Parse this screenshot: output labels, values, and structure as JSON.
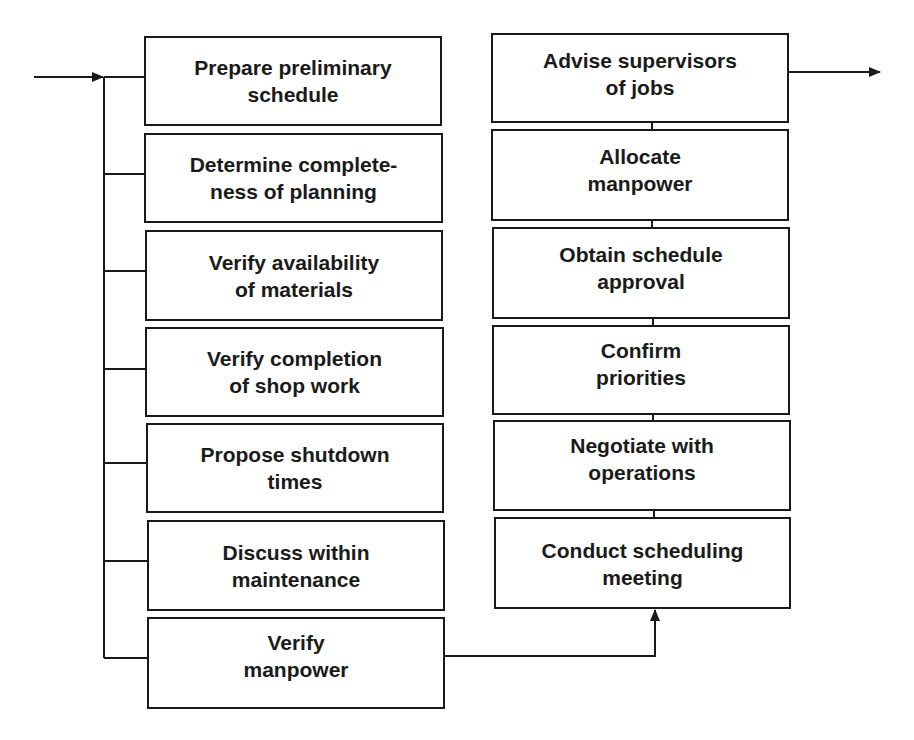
{
  "diagram": {
    "type": "flowchart",
    "left_column": {
      "label": "Preparation steps (parallel inputs)",
      "boxes": [
        {
          "line1": "Prepare preliminary",
          "line2": "schedule"
        },
        {
          "line1": "Determine complete-",
          "line2": "ness of planning"
        },
        {
          "line1": "Verify availability",
          "line2": "of materials"
        },
        {
          "line1": "Verify completion",
          "line2": "of shop work"
        },
        {
          "line1": "Propose shutdown",
          "line2": "times"
        },
        {
          "line1": "Discuss within",
          "line2": "maintenance"
        },
        {
          "line1": "Verify",
          "line2": "manpower"
        }
      ]
    },
    "right_column": {
      "label": "Scheduling steps (bottom to top)",
      "boxes": [
        {
          "line1": "Advise supervisors",
          "line2": "of jobs"
        },
        {
          "line1": "Allocate",
          "line2": "manpower"
        },
        {
          "line1": "Obtain schedule",
          "line2": "approval"
        },
        {
          "line1": "Confirm",
          "line2": "priorities"
        },
        {
          "line1": "Negotiate with",
          "line2": "operations"
        },
        {
          "line1": "Conduct scheduling",
          "line2": "meeting"
        }
      ]
    },
    "edges": [
      {
        "from": "entry",
        "to": "left_column_bus",
        "arrow": true
      },
      {
        "from": "Verify manpower",
        "to": "Conduct scheduling meeting",
        "arrow": true
      },
      {
        "from": "Advise supervisors of jobs",
        "to": "exit",
        "arrow": true
      }
    ],
    "colors": {
      "stroke": "#1a1a1a",
      "background": "#ffffff"
    }
  }
}
